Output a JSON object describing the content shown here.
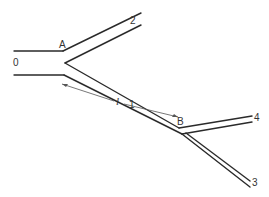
{
  "diagram": {
    "type": "pipe-network",
    "labels": {
      "pipe_0": "0",
      "pipe_1": "1",
      "pipe_2": "2",
      "pipe_3": "3",
      "pipe_4": "4",
      "junction_a": "A",
      "junction_b": "B",
      "length": "l"
    },
    "colors": {
      "line": "#2a2a2a",
      "background": "#ffffff"
    }
  }
}
